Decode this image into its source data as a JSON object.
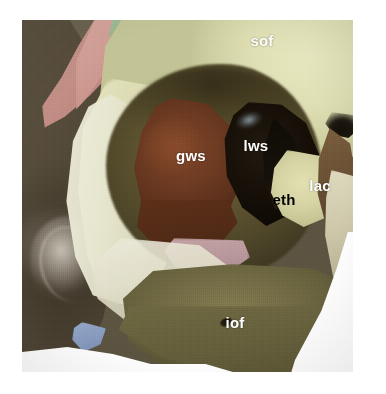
{
  "figure": {
    "view": "anterolateral photograph of the right orbit",
    "canvas": {
      "width": 386,
      "height": 394
    },
    "plate": {
      "left": 22,
      "top": 20,
      "width": 331,
      "height": 352
    },
    "background_color": "#ffffff"
  },
  "palette": {
    "frontal_bone": "#dedeb2",
    "temporal_bone": "#544a39",
    "pink_band": "#c99289",
    "green_chip": "#8db58a",
    "orbit_cavity": "#5e5430",
    "greater_wing_sphenoid": "#6e3b22",
    "lesser_wing_sphenoid": "#181109",
    "ethmoid_plate": "#d7d5a5",
    "lacrimal_region": "#6b5134",
    "maxilla": "#726b45",
    "orbital_floor_pink": "#b6959a",
    "blue_sliver": "#8da3cc",
    "label_white": "#ffffff",
    "label_black": "#000000"
  },
  "labels": [
    {
      "id": "sof",
      "text": "sof",
      "meaning": "superior orbital fissure",
      "color": "white",
      "x": 262,
      "y": 40
    },
    {
      "id": "gws",
      "text": "gws",
      "meaning": "greater wing of sphenoid",
      "color": "white",
      "x": 191,
      "y": 155
    },
    {
      "id": "lws",
      "text": "lws",
      "meaning": "lesser wing of sphenoid",
      "color": "white",
      "x": 256,
      "y": 145
    },
    {
      "id": "eth",
      "text": "eth",
      "meaning": "ethmoid",
      "color": "black",
      "x": 284,
      "y": 199
    },
    {
      "id": "lac",
      "text": "lac",
      "meaning": "lacrimal",
      "color": "white",
      "x": 320,
      "y": 185
    },
    {
      "id": "iof",
      "text": "iof",
      "meaning": "infraorbital foramen",
      "color": "white",
      "x": 235,
      "y": 322
    }
  ]
}
